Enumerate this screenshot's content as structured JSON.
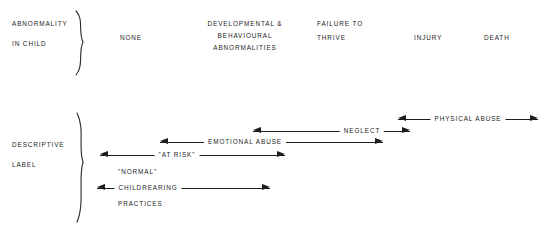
{
  "diagram": {
    "line_color": "#1d1d1d",
    "text_color": "#232323",
    "background": "#ffffff"
  },
  "rows": {
    "top": {
      "label_line1": "ABNORMALITY",
      "label_line2": "IN CHILD"
    },
    "bottom": {
      "label_line1": "DESCRIPTIVE",
      "label_line2": "LABEL"
    }
  },
  "columns": [
    {
      "id": "none",
      "lines": [
        "NONE"
      ],
      "x": 131,
      "y": 38,
      "align": "center"
    },
    {
      "id": "developmental",
      "lines": [
        "DEVELOPMENTAL &",
        "BEHAVIOURAL",
        "ABNORMALITIES"
      ],
      "x": 245,
      "y": 24,
      "align": "center"
    },
    {
      "id": "failure",
      "lines": [
        "FAILURE TO",
        "THRIVE"
      ],
      "x": 317,
      "y": 24,
      "align": "left"
    },
    {
      "id": "injury",
      "lines": [
        "INJURY"
      ],
      "x": 414,
      "y": 38,
      "align": "left"
    },
    {
      "id": "death",
      "lines": [
        "DEATH"
      ],
      "x": 484,
      "y": 38,
      "align": "left"
    }
  ],
  "spectrum_arrows": [
    {
      "id": "physical-abuse",
      "label": "PHYSICAL ABUSE",
      "x1": 398,
      "x2": 538,
      "y": 113,
      "left_head": true,
      "right_head": true,
      "label_x": 468
    },
    {
      "id": "neglect",
      "label": "NEGLECT",
      "x1": 253,
      "x2": 410,
      "y": 125,
      "left_head": true,
      "right_head": true,
      "label_x": 362
    },
    {
      "id": "emotional-abuse",
      "label": "EMOTIONAL ABUSE",
      "x1": 160,
      "x2": 383,
      "y": 136,
      "left_head": true,
      "right_head": true,
      "label_x": 245
    },
    {
      "id": "at-risk",
      "label": "\"AT RISK\"",
      "x1": 100,
      "x2": 285,
      "y": 149,
      "left_head": true,
      "right_head": true,
      "label_x": 177
    },
    {
      "id": "childrearing",
      "label": "CHILDREARING",
      "x1": 97,
      "x2": 270,
      "y": 182,
      "left_head": true,
      "right_head": true,
      "label_x": 148
    }
  ],
  "free_labels": [
    {
      "id": "normal",
      "text": "\"NORMAL\"",
      "x": 118,
      "y": 167
    },
    {
      "id": "practices",
      "text": "PRACTICES",
      "x": 118,
      "y": 199
    }
  ]
}
